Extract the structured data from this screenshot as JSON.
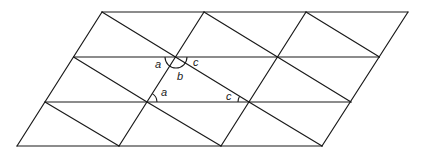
{
  "diagram": {
    "type": "triangle-tessellation",
    "colors": {
      "stroke": "#1a1a1a",
      "background": "#ffffff"
    },
    "grid": {
      "rows_y": [
        12,
        57,
        102,
        146
      ],
      "row0_x": [
        102,
        204,
        306,
        408
      ],
      "row_shift_x": -28.5
    },
    "angle_labels": [
      {
        "id": "top-a",
        "text": "a",
        "x": 155,
        "y": 68
      },
      {
        "id": "top-b",
        "text": "b",
        "x": 177,
        "y": 80
      },
      {
        "id": "top-c",
        "text": "c",
        "x": 193,
        "y": 66
      },
      {
        "id": "bottom-a",
        "text": "a",
        "x": 161,
        "y": 96
      },
      {
        "id": "bottom-c",
        "text": "c",
        "x": 226,
        "y": 100
      }
    ]
  }
}
